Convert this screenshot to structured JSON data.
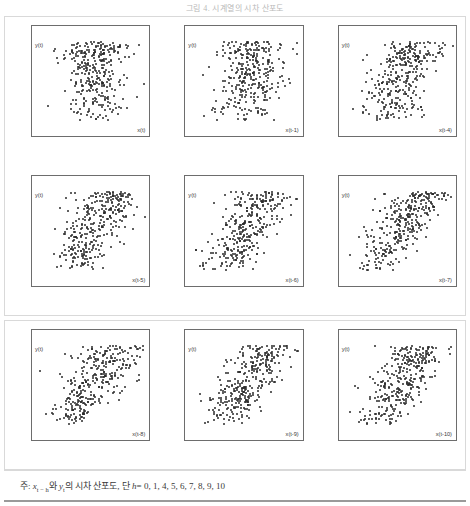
{
  "title": "그림 4. 시계열의 시차 산포도",
  "caption": {
    "prefix": "주:",
    "body_1": "x",
    "sub_1": "t − h",
    "body_2": "와",
    "body_3": "y",
    "sub_2": "t",
    "body_4": "의 시차 산포도, 단",
    "body_5": "h",
    "body_6": "= 0,  1,  4,  5,  6,  7,  8,  9,  10",
    "full_text": "주: x(t-h)와 y(t)의 시차 산포도, 단 h = 0, 1, 4, 5, 6, 7, 8, 9, 10"
  },
  "axes": {
    "y_ticks": [
      "120",
      "100",
      "80",
      "60",
      "40",
      "20",
      "0",
      "-20"
    ],
    "y_tick_values": [
      120,
      100,
      80,
      60,
      40,
      20,
      0,
      -20
    ],
    "x_ticks": [
      "-1.5",
      "-1.0",
      "-0.5",
      "0.0",
      "0.5",
      "1.0",
      "1.5"
    ],
    "x_tick_values": [
      -1.5,
      -1.0,
      -0.5,
      0.0,
      0.5,
      1.0,
      1.5
    ],
    "ylim": [
      -20,
      120
    ],
    "xlim": [
      -1.5,
      1.5
    ],
    "ylabel": "y(t)"
  },
  "chart_data": {
    "type": "scatter",
    "title": "그림 4. 시계열의 시차 산포도",
    "xlabel": "x(t-h)",
    "ylabel": "y(t)",
    "xlim": [
      -1.5,
      1.5
    ],
    "ylim": [
      -20,
      120
    ],
    "grid": false,
    "legend": "none",
    "marker_color": "#2b2b2b",
    "lags": [
      0,
      1,
      4,
      5,
      6,
      7,
      8,
      9,
      10
    ],
    "panels": [
      {
        "lag": 0,
        "xlabel": "x(t)",
        "ylabel": "y(t)",
        "n_points": 330,
        "pattern": "diffuse-cloud",
        "correlation": -0.05
      },
      {
        "lag": 1,
        "xlabel": "x(t-1)",
        "ylabel": "y(t)",
        "n_points": 330,
        "pattern": "diffuse-cloud",
        "correlation": -0.12
      },
      {
        "lag": 4,
        "xlabel": "x(t-4)",
        "ylabel": "y(t)",
        "n_points": 330,
        "pattern": "weak-negative",
        "correlation": -0.34
      },
      {
        "lag": 5,
        "xlabel": "x(t-5)",
        "ylabel": "y(t)",
        "n_points": 330,
        "pattern": "negative-wedge",
        "correlation": -0.46
      },
      {
        "lag": 6,
        "xlabel": "x(t-6)",
        "ylabel": "y(t)",
        "n_points": 330,
        "pattern": "negative-wedge",
        "correlation": -0.55
      },
      {
        "lag": 7,
        "xlabel": "x(t-7)",
        "ylabel": "y(t)",
        "n_points": 330,
        "pattern": "negative-triangle",
        "correlation": -0.6
      },
      {
        "lag": 8,
        "xlabel": "x(t-8)",
        "ylabel": "y(t)",
        "n_points": 330,
        "pattern": "negative-triangle",
        "correlation": -0.58
      },
      {
        "lag": 9,
        "xlabel": "x(t-9)",
        "ylabel": "y(t)",
        "n_points": 330,
        "pattern": "negative-triangle",
        "correlation": -0.56
      },
      {
        "lag": 10,
        "xlabel": "x(t-10)",
        "ylabel": "y(t)",
        "n_points": 330,
        "pattern": "negative-triangle",
        "correlation": -0.54
      }
    ]
  }
}
